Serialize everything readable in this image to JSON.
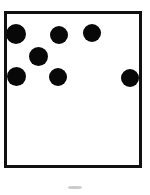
{
  "figure": {
    "background_color": "#ffffff",
    "width": 150,
    "height": 195
  },
  "box": {
    "label": "square-frame",
    "x": 4,
    "y": 11,
    "width": 138,
    "height": 157,
    "border_width": 3,
    "border_color": "#111111",
    "fill_color": "#ffffff"
  },
  "dots": {
    "count": 7,
    "color": "#080808",
    "items": [
      {
        "label": "dot-top-left",
        "cx": 16,
        "cy": 34,
        "d": 20
      },
      {
        "label": "dot-top-middle",
        "cx": 59,
        "cy": 35,
        "d": 18
      },
      {
        "label": "dot-top-right",
        "cx": 92,
        "cy": 33,
        "d": 18
      },
      {
        "label": "dot-center-upper",
        "cx": 38,
        "cy": 56,
        "d": 19
      },
      {
        "label": "dot-mid-left",
        "cx": 16,
        "cy": 76,
        "d": 19
      },
      {
        "label": "dot-mid-middle",
        "cx": 58,
        "cy": 77,
        "d": 18
      },
      {
        "label": "dot-mid-right",
        "cx": 130,
        "cy": 78,
        "d": 18
      }
    ]
  },
  "smudge": {
    "label": "faint-mark-below-box",
    "x": 68,
    "y": 186,
    "width": 14,
    "height": 3,
    "color": "#b9b9b9"
  }
}
